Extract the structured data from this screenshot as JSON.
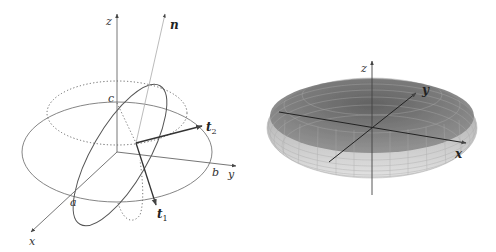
{
  "left_figure": {
    "labels": {
      "z": "z",
      "n": "n",
      "c": "c",
      "t2": "t",
      "t2_sub": "2",
      "b": "b",
      "y": "y",
      "a": "a",
      "t1": "t",
      "t1_sub": "1",
      "x": "x"
    }
  },
  "right_figure": {
    "labels": {
      "z": "z",
      "y": "y",
      "x": "x"
    }
  },
  "colors": {
    "line": "#555555",
    "light_line": "#999999",
    "ellipsoid_top": "#6e6e6e",
    "ellipsoid_side": "#c8c8c8"
  }
}
